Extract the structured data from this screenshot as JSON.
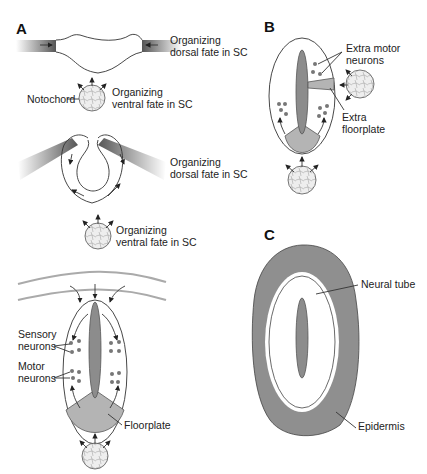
{
  "panels": {
    "A": {
      "letter": "A",
      "stage1": {
        "dorsal_label_1": "Organizing",
        "dorsal_label_2": "dorsal fate in SC",
        "notochord_label": "Notochord",
        "ventral_label_1": "Organizing",
        "ventral_label_2": "ventral fate in SC"
      },
      "stage2": {
        "dorsal_label_1": "Organizing",
        "dorsal_label_2": "dorsal fate in SC",
        "ventral_label_1": "Organizing",
        "ventral_label_2": "ventral fate in SC"
      },
      "stage3": {
        "sensory_label_1": "Sensory",
        "sensory_label_2": "neurons",
        "motor_label_1": "Motor",
        "motor_label_2": "neurons",
        "floorplate_label": "Floorplate"
      }
    },
    "B": {
      "letter": "B",
      "extra_motor_1": "Extra motor",
      "extra_motor_2": "neurons",
      "extra_floor_1": "Extra",
      "extra_floor_2": "floorplate"
    },
    "C": {
      "letter": "C",
      "neural_tube_label": "Neural tube",
      "epidermis_label": "Epidermis"
    }
  },
  "colors": {
    "tissue_gray": "#8c8c8c",
    "floorplate_gray": "#b4b4b4",
    "line": "#333333"
  }
}
